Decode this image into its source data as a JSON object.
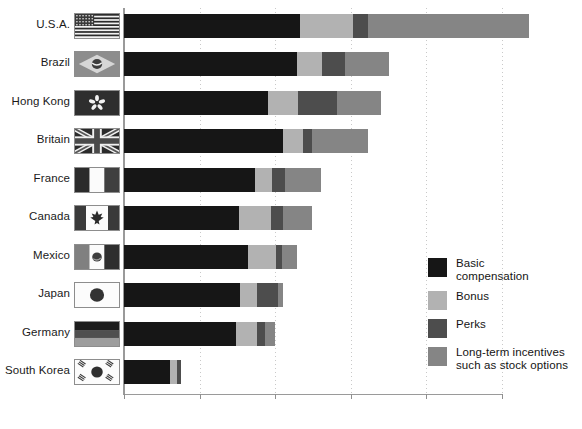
{
  "chart_data": {
    "type": "bar",
    "orientation": "horizontal",
    "stacked": true,
    "title": "",
    "subtitle": "",
    "xlabel": "",
    "ylabel": "",
    "xlim": [
      0,
      1100000
    ],
    "axis_max_tick": 1000000,
    "grid": true,
    "grid_axis": "x",
    "legend_position": "right-lower",
    "categories": [
      "U.S.A.",
      "Brazil",
      "Hong Kong",
      "Britain",
      "France",
      "Canada",
      "Mexico",
      "Japan",
      "Germany",
      "South Korea"
    ],
    "totals": [
      1072400,
      701219,
      680616,
      645540,
      520389,
      498118,
      456902,
      420855,
      398430,
      150711
    ],
    "total_labels": [
      "$1 072 400",
      "$701 219",
      "$680 616",
      "$645 540",
      "$520 389",
      "$498 118",
      "$456 902",
      "$420 855",
      "$398 430",
      "$150 711"
    ],
    "series": [
      {
        "name": "Basic compensation",
        "key": "basic",
        "color": "#161616",
        "values": [
          466000,
          458000,
          381000,
          421000,
          347000,
          304000,
          328000,
          307000,
          296000,
          122000
        ]
      },
      {
        "name": "Bonus",
        "key": "bonus",
        "color": "#b2b2b2",
        "values": [
          140000,
          66000,
          79000,
          53000,
          45000,
          85000,
          74000,
          45000,
          56000,
          18000
        ]
      },
      {
        "name": "Perks",
        "key": "perks",
        "color": "#4d4d4d",
        "values": [
          40000,
          61000,
          103000,
          24000,
          34000,
          32000,
          16000,
          56000,
          21000,
          11000
        ]
      },
      {
        "name": "Long-term incentives such as stock options",
        "key": "lti",
        "color": "#858585",
        "values": [
          426400,
          116219,
          117616,
          147540,
          94389,
          77118,
          38902,
          12855,
          25430,
          0
        ]
      }
    ],
    "xticks": [
      0,
      200000,
      400000,
      600000,
      800000,
      1000000
    ],
    "xtick_labels": [
      "0",
      "$200 000",
      "$400 000",
      "$600 000",
      "$800 000",
      "$1 000 000"
    ]
  },
  "legend": {
    "items": [
      {
        "label": "Basic\ncompensation",
        "line1": "Basic",
        "line2": "compensation",
        "color": "#161616",
        "swatch": "legend-swatch-basic"
      },
      {
        "label": "Bonus",
        "line1": "Bonus",
        "line2": "",
        "color": "#b2b2b2",
        "swatch": "legend-swatch-bonus"
      },
      {
        "label": "Perks",
        "line1": "Perks",
        "line2": "",
        "color": "#4d4d4d",
        "swatch": "legend-swatch-perks"
      },
      {
        "label": "Long-term incentives such as stock options",
        "line1": "Long-term incentives",
        "line2": "such as stock options",
        "color": "#858585",
        "swatch": "legend-swatch-lti"
      }
    ]
  },
  "flags": {
    "items": [
      {
        "country": "U.S.A.",
        "icon": "flag-usa-icon"
      },
      {
        "country": "Brazil",
        "icon": "flag-brazil-icon"
      },
      {
        "country": "Hong Kong",
        "icon": "flag-hongkong-icon"
      },
      {
        "country": "Britain",
        "icon": "flag-britain-icon"
      },
      {
        "country": "France",
        "icon": "flag-france-icon"
      },
      {
        "country": "Canada",
        "icon": "flag-canada-icon"
      },
      {
        "country": "Mexico",
        "icon": "flag-mexico-icon"
      },
      {
        "country": "Japan",
        "icon": "flag-japan-icon"
      },
      {
        "country": "Germany",
        "icon": "flag-germany-icon"
      },
      {
        "country": "South Korea",
        "icon": "flag-southkorea-icon"
      }
    ]
  },
  "colors": {
    "basic": "#161616",
    "bonus": "#b2b2b2",
    "perks": "#4d4d4d",
    "lti": "#858585",
    "axis": "#9a9a9a",
    "grid": "#c9c9c9",
    "text": "#141414"
  }
}
